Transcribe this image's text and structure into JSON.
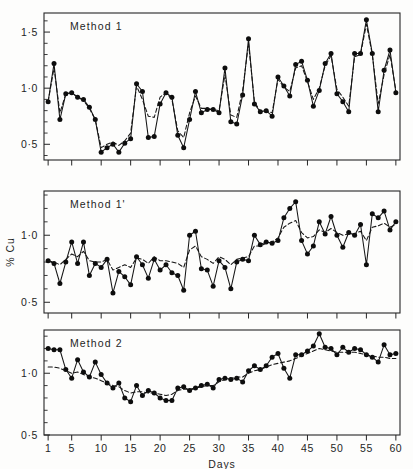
{
  "figure": {
    "axis_title_y": "% Cu",
    "axis_title_x": "Days",
    "background": "#fdfdfc",
    "ink_color": "#151515"
  },
  "chart_data": [
    {
      "type": "line",
      "title": "Method 1",
      "panel_index": 0,
      "xlabel": "",
      "ylabel": "% Cu",
      "xlim": [
        0.3,
        60.7
      ],
      "ylim": [
        0.36,
        1.67
      ],
      "grid": false,
      "legend": "none",
      "y_ticks_major": [
        0.5,
        1.0,
        1.5
      ],
      "y_tick_labels": [
        "0·5",
        "1·0",
        "1·5"
      ],
      "y_ticks_minor": [
        0.4,
        0.6,
        0.7,
        0.8,
        0.9,
        1.1,
        1.2,
        1.3,
        1.4,
        1.6
      ],
      "x_ticks_major": [
        1,
        5,
        10,
        15,
        20,
        25,
        30,
        35,
        40,
        45,
        50,
        55,
        60
      ],
      "x_tick_labels_shown": false,
      "x": [
        1,
        2,
        3,
        4,
        5,
        6,
        7,
        8,
        9,
        10,
        11,
        12,
        13,
        14,
        15,
        16,
        17,
        18,
        19,
        20,
        21,
        22,
        23,
        24,
        25,
        26,
        27,
        28,
        29,
        30,
        31,
        32,
        33,
        34,
        35,
        36,
        37,
        38,
        39,
        40,
        41,
        42,
        43,
        44,
        45,
        46,
        47,
        48,
        49,
        50,
        51,
        52,
        53,
        54,
        55,
        56,
        57,
        58,
        59,
        60
      ],
      "series": [
        {
          "name": "observed",
          "style": "solid-with-markers",
          "values": [
            0.88,
            1.22,
            0.72,
            0.95,
            0.96,
            0.92,
            0.9,
            0.83,
            0.72,
            0.43,
            0.47,
            0.5,
            0.43,
            0.51,
            0.55,
            1.04,
            0.97,
            0.56,
            0.57,
            0.86,
            0.96,
            0.92,
            0.58,
            0.47,
            0.72,
            0.97,
            0.78,
            0.81,
            0.81,
            0.78,
            1.18,
            0.7,
            0.68,
            0.94,
            1.44,
            0.86,
            0.79,
            0.8,
            0.75,
            1.1,
            1.02,
            0.93,
            1.21,
            1.24,
            1.07,
            0.84,
            0.98,
            1.22,
            1.31,
            0.95,
            0.88,
            0.79,
            1.31,
            1.31,
            1.61,
            1.31,
            0.79,
            1.16,
            1.34,
            0.96,
            0.96,
            1.04,
            1.52
          ]
        },
        {
          "name": "smoothed",
          "style": "dashed",
          "values": [
            0.88,
            1.18,
            0.78,
            0.95,
            0.96,
            0.92,
            0.89,
            0.82,
            0.72,
            0.47,
            0.5,
            0.52,
            0.49,
            0.53,
            0.6,
            1.02,
            0.9,
            0.75,
            0.74,
            0.92,
            0.96,
            0.9,
            0.62,
            0.56,
            0.78,
            0.93,
            0.82,
            0.82,
            0.81,
            0.8,
            1.12,
            0.76,
            0.74,
            0.98,
            1.4,
            0.88,
            0.79,
            0.8,
            0.78,
            1.08,
            1.01,
            0.97,
            1.18,
            1.2,
            1.06,
            0.9,
            1.0,
            1.2,
            1.29,
            0.99,
            0.92,
            0.84,
            1.28,
            1.3,
            1.57,
            1.3,
            0.86,
            1.12,
            1.3,
            0.98,
            0.97,
            1.05,
            1.48
          ]
        }
      ]
    },
    {
      "type": "line",
      "title": "Method 1'",
      "panel_index": 1,
      "xlabel": "",
      "ylabel": "% Cu",
      "xlim": [
        0.3,
        60.7
      ],
      "ylim": [
        0.42,
        1.33
      ],
      "grid": false,
      "legend": "none",
      "y_ticks_major": [
        0.5,
        1.0
      ],
      "y_tick_labels": [
        "0·5",
        "1·0"
      ],
      "y_ticks_minor": [
        0.6,
        0.7,
        0.8,
        0.9,
        1.1,
        1.2,
        1.3
      ],
      "x_ticks_major": [
        1,
        5,
        10,
        15,
        20,
        25,
        30,
        35,
        40,
        45,
        50,
        55,
        60
      ],
      "x_tick_labels_shown": false,
      "x": [
        1,
        2,
        3,
        4,
        5,
        6,
        7,
        8,
        9,
        10,
        11,
        12,
        13,
        14,
        15,
        16,
        17,
        18,
        19,
        20,
        21,
        22,
        23,
        24,
        25,
        26,
        27,
        28,
        29,
        30,
        31,
        32,
        33,
        34,
        35,
        36,
        37,
        38,
        39,
        40,
        41,
        42,
        43,
        44,
        45,
        46,
        47,
        48,
        49,
        50,
        51,
        52,
        53,
        54,
        55,
        56,
        57,
        58,
        59,
        60
      ],
      "series": [
        {
          "name": "observed",
          "style": "solid-with-markers",
          "values": [
            0.81,
            0.79,
            0.64,
            0.8,
            0.95,
            0.79,
            0.95,
            0.7,
            0.79,
            0.76,
            0.82,
            0.57,
            0.73,
            0.69,
            0.63,
            0.84,
            0.78,
            0.68,
            0.82,
            0.74,
            0.78,
            0.72,
            0.7,
            0.59,
            1.0,
            1.03,
            0.75,
            0.74,
            0.62,
            0.81,
            0.76,
            0.6,
            0.8,
            0.82,
            0.81,
            1.0,
            0.93,
            0.95,
            0.94,
            0.96,
            1.13,
            1.2,
            1.25,
            0.96,
            0.86,
            0.92,
            1.1,
            1.01,
            1.14,
            1.0,
            0.91,
            1.02,
            1.0,
            1.08,
            0.78,
            1.16,
            1.13,
            1.18,
            1.04,
            1.1,
            1.08,
            1.31
          ]
        },
        {
          "name": "smoothed",
          "style": "dashed",
          "values": [
            0.81,
            0.8,
            0.78,
            0.82,
            0.86,
            0.84,
            0.88,
            0.81,
            0.8,
            0.8,
            0.82,
            0.74,
            0.76,
            0.78,
            0.76,
            0.83,
            0.82,
            0.79,
            0.84,
            0.81,
            0.81,
            0.8,
            0.79,
            0.76,
            0.89,
            0.92,
            0.84,
            0.82,
            0.79,
            0.84,
            0.82,
            0.78,
            0.82,
            0.83,
            0.84,
            0.92,
            0.92,
            0.94,
            0.95,
            0.98,
            1.06,
            1.09,
            1.11,
            1.02,
            0.98,
            0.99,
            1.04,
            1.02,
            1.05,
            1.02,
            1.0,
            1.01,
            1.01,
            1.03,
            0.96,
            1.06,
            1.07,
            1.09,
            1.06,
            1.08,
            1.08,
            1.14
          ]
        }
      ]
    },
    {
      "type": "line",
      "title": "Method 2",
      "panel_index": 2,
      "xlabel": "Days",
      "ylabel": "% Cu",
      "xlim": [
        0.3,
        60.7
      ],
      "ylim": [
        0.5,
        1.35
      ],
      "grid": false,
      "legend": "none",
      "y_ticks_major": [
        0.5,
        1.0
      ],
      "y_tick_labels": [
        "0·5",
        "1·0"
      ],
      "y_ticks_minor": [
        0.6,
        0.7,
        0.8,
        0.9,
        1.1,
        1.2,
        1.3
      ],
      "x_ticks_major": [
        1,
        5,
        10,
        15,
        20,
        25,
        30,
        35,
        40,
        45,
        50,
        55,
        60
      ],
      "x_tick_labels": [
        "1",
        "5",
        "10",
        "15",
        "20",
        "25",
        "30",
        "35",
        "40",
        "45",
        "50",
        "55",
        "60"
      ],
      "x_tick_labels_shown": true,
      "x": [
        1,
        2,
        3,
        4,
        5,
        6,
        7,
        8,
        9,
        10,
        11,
        12,
        13,
        14,
        15,
        16,
        17,
        18,
        19,
        20,
        21,
        22,
        23,
        24,
        25,
        26,
        27,
        28,
        29,
        30,
        31,
        32,
        33,
        34,
        35,
        36,
        37,
        38,
        39,
        40,
        41,
        42,
        43,
        44,
        45,
        46,
        47,
        48,
        49,
        50,
        51,
        52,
        53,
        54,
        55,
        56,
        57,
        58,
        59,
        60
      ],
      "series": [
        {
          "name": "observed",
          "style": "solid-with-markers",
          "values": [
            1.2,
            1.19,
            1.19,
            1.03,
            0.96,
            1.11,
            1.01,
            0.97,
            1.09,
            0.99,
            0.92,
            0.88,
            0.92,
            0.8,
            0.77,
            0.9,
            0.82,
            0.86,
            0.84,
            0.8,
            0.78,
            0.78,
            0.88,
            0.89,
            0.86,
            0.88,
            0.9,
            0.91,
            0.88,
            0.95,
            0.96,
            0.95,
            0.96,
            0.93,
            1.02,
            1.06,
            1.03,
            1.06,
            1.13,
            1.16,
            1.04,
            0.96,
            1.15,
            1.15,
            1.18,
            1.22,
            1.32,
            1.21,
            1.2,
            1.15,
            1.21,
            1.17,
            1.2,
            1.19,
            1.15,
            1.13,
            1.09,
            1.23,
            1.15,
            1.16
          ]
        },
        {
          "name": "smoothed",
          "style": "dashed",
          "values": [
            1.05,
            1.05,
            1.04,
            1.02,
            1.0,
            1.01,
            0.99,
            0.97,
            0.96,
            0.94,
            0.92,
            0.9,
            0.89,
            0.86,
            0.84,
            0.85,
            0.85,
            0.84,
            0.84,
            0.83,
            0.82,
            0.83,
            0.86,
            0.87,
            0.87,
            0.88,
            0.89,
            0.9,
            0.9,
            0.93,
            0.95,
            0.96,
            0.97,
            0.97,
            1.0,
            1.02,
            1.03,
            1.05,
            1.07,
            1.08,
            1.09,
            1.1,
            1.12,
            1.14,
            1.16,
            1.18,
            1.2,
            1.19,
            1.18,
            1.17,
            1.17,
            1.17,
            1.17,
            1.16,
            1.15,
            1.14,
            1.13,
            1.13,
            1.12,
            1.12
          ]
        }
      ]
    }
  ]
}
